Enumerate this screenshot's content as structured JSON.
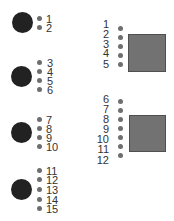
{
  "colors": {
    "circle": "#222222",
    "square": "#727272",
    "dot": "#6e6e6e",
    "label": "#333333"
  },
  "left_groups": [
    {
      "shape": "circle",
      "labels": [
        "1",
        "2"
      ]
    },
    {
      "shape": "circle",
      "labels": [
        "3",
        "4",
        "5",
        "6"
      ]
    },
    {
      "shape": "circle",
      "labels": [
        "7",
        "8",
        "9",
        "10"
      ]
    },
    {
      "shape": "circle",
      "labels": [
        "11",
        "12",
        "13",
        "14",
        "15"
      ]
    }
  ],
  "right_groups": [
    {
      "shape": "square",
      "labels": [
        "1",
        "2",
        "3",
        "4",
        "5"
      ]
    },
    {
      "shape": "square",
      "labels": [
        "6",
        "7",
        "8",
        "9",
        "10",
        "11",
        "12"
      ]
    }
  ]
}
